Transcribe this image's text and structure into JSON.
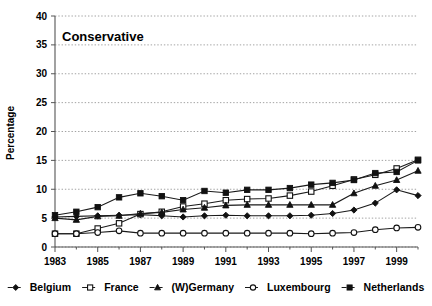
{
  "chart_data": {
    "type": "line",
    "title": "Conservative",
    "xlabel": "",
    "ylabel": "Percentage",
    "ylim": [
      0,
      40
    ],
    "ytick_step": 5,
    "yticks": [
      "0",
      "5",
      "10",
      "15",
      "20",
      "25",
      "30",
      "35",
      "40"
    ],
    "xlim": [
      1983,
      2000
    ],
    "xticks": [
      "1983",
      "1985",
      "1987",
      "1989",
      "1991",
      "1993",
      "1995",
      "1997",
      "1999"
    ],
    "x": [
      1983,
      1984,
      1985,
      1986,
      1987,
      1988,
      1989,
      1990,
      1991,
      1992,
      1993,
      1994,
      1995,
      1996,
      1997,
      1998,
      1999,
      2000
    ],
    "grid": "horizontal",
    "legend_position": "bottom",
    "series": [
      {
        "name": "Belgium",
        "marker": "filled-diamond",
        "values": [
          5.2,
          5.3,
          5.4,
          5.5,
          5.6,
          5.4,
          5.2,
          5.4,
          5.5,
          5.4,
          5.4,
          5.4,
          5.5,
          5.8,
          6.4,
          7.6,
          9.9,
          8.9
        ]
      },
      {
        "name": "France",
        "marker": "open-square",
        "values": [
          2.3,
          2.3,
          3.2,
          4.1,
          5.7,
          6.1,
          7.0,
          7.5,
          8.1,
          8.3,
          8.4,
          8.9,
          9.6,
          10.6,
          11.7,
          12.5,
          13.6,
          15.1
        ]
      },
      {
        "name": "(W)Germany",
        "marker": "filled-triangle",
        "values": [
          5.0,
          4.7,
          5.3,
          5.4,
          5.8,
          6.0,
          6.5,
          6.8,
          7.2,
          7.3,
          7.3,
          7.3,
          7.3,
          7.3,
          9.3,
          10.6,
          11.6,
          13.2
        ]
      },
      {
        "name": "Luxembourg",
        "marker": "open-circle",
        "values": [
          2.3,
          2.3,
          2.5,
          2.8,
          2.4,
          2.4,
          2.4,
          2.4,
          2.4,
          2.4,
          2.4,
          2.4,
          2.3,
          2.4,
          2.5,
          3.0,
          3.3,
          3.4
        ]
      },
      {
        "name": "Netherlands",
        "marker": "filled-square",
        "values": [
          5.5,
          6.1,
          6.9,
          8.6,
          9.3,
          8.8,
          8.1,
          9.7,
          9.4,
          9.9,
          9.9,
          10.2,
          10.8,
          11.1,
          11.6,
          12.8,
          13.0,
          15.0
        ]
      }
    ]
  }
}
